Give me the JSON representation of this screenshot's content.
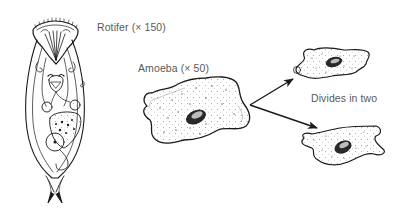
{
  "labels": {
    "rotifer": "Rotifer (× 150)",
    "amoeba": "Amoeba (× 50)",
    "divides": "Divides in two"
  },
  "colors": {
    "ink": "#1a1a1a",
    "label": "#5a5a5a",
    "background": "#ffffff"
  },
  "figures": [
    {
      "name": "rotifer",
      "magnification": "× 150"
    },
    {
      "name": "amoeba",
      "magnification": "× 50"
    },
    {
      "name": "daughter-amoeba-top"
    },
    {
      "name": "daughter-amoeba-bottom"
    }
  ],
  "arrows": [
    {
      "from": "amoeba",
      "to": "daughter-amoeba-top"
    },
    {
      "from": "amoeba",
      "to": "daughter-amoeba-bottom"
    }
  ]
}
